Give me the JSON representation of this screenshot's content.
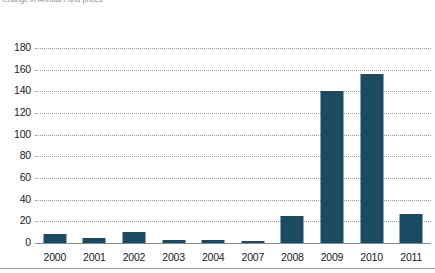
{
  "title_strip": {
    "text": "Change in Annual Fund prices"
  },
  "axis": {
    "y_ticks": [
      180,
      160,
      140,
      120,
      100,
      80,
      60,
      40,
      20,
      0
    ],
    "y_axis_label": "",
    "x_axis_label": ""
  },
  "colors": {
    "bar": "#1b4a63",
    "gridline": "#9a9a9a",
    "baseline": "#8a8a8a",
    "background": "#ffffff",
    "text": "#1a1a1a"
  },
  "chart_data": {
    "type": "bar",
    "title": "",
    "xlabel": "",
    "ylabel": "",
    "ylim": [
      0,
      180
    ],
    "ytick_step": 20,
    "grid": true,
    "grid_style": "dotted-horizontal",
    "legend": false,
    "categories": [
      "2000",
      "2001",
      "2002",
      "2003",
      "2004",
      "2007",
      "2008",
      "2009",
      "2010",
      "2011"
    ],
    "values": [
      8,
      5,
      10,
      3,
      3,
      2,
      25,
      140,
      156,
      27
    ]
  }
}
